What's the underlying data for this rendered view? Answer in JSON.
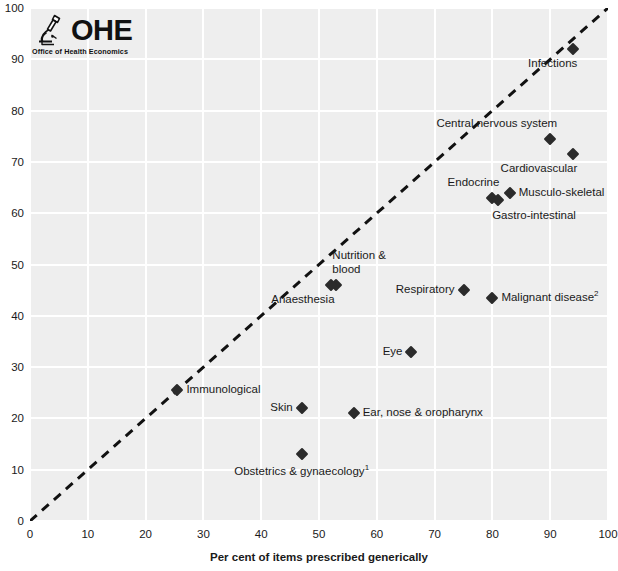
{
  "logo": {
    "wordmark": "OHE",
    "tagline": "Office of Health Economics",
    "icon": "microscope-icon"
  },
  "chart_data": {
    "type": "scatter",
    "title": "",
    "xlabel": "Per cent of items prescribed generically",
    "ylabel": "",
    "xlim": [
      0,
      100
    ],
    "ylim": [
      0,
      100
    ],
    "xticks": [
      0,
      10,
      20,
      30,
      40,
      50,
      60,
      70,
      80,
      90,
      100
    ],
    "yticks": [
      0,
      10,
      20,
      30,
      40,
      50,
      60,
      70,
      80,
      90,
      100
    ],
    "grid": true,
    "legend": "none",
    "reference_line": {
      "name": "parity-line",
      "style": "dashed",
      "from": [
        0,
        0
      ],
      "to": [
        100,
        100
      ]
    },
    "points": [
      {
        "label": "Infections",
        "x": 94,
        "y": 92,
        "label_pos": "below-left"
      },
      {
        "label": "Central nervous system",
        "x": 90,
        "y": 74.5,
        "label_pos": "above-left"
      },
      {
        "label": "Cardiovascular",
        "x": 94,
        "y": 71.5,
        "label_pos": "below-left"
      },
      {
        "label": "Musculo-skeletal",
        "x": 83,
        "y": 64,
        "label_pos": "right"
      },
      {
        "label": "Endocrine",
        "x": 80,
        "y": 63,
        "label_pos": "above-left"
      },
      {
        "label": "Gastro-intestinal",
        "x": 81,
        "y": 62.5,
        "label_pos": "below-right"
      },
      {
        "label": "Nutrition & blood",
        "x": 53,
        "y": 46,
        "label_pos": "above-right"
      },
      {
        "label": "Anaesthesia",
        "x": 52,
        "y": 46,
        "label_pos": "below-left"
      },
      {
        "label": "Respiratory",
        "x": 75,
        "y": 45,
        "label_pos": "left"
      },
      {
        "label": "Malignant disease",
        "x": 80,
        "y": 43.5,
        "label_pos": "right",
        "footnote": "2"
      },
      {
        "label": "Eye",
        "x": 66,
        "y": 33,
        "label_pos": "left"
      },
      {
        "label": "Immunological",
        "x": 25.5,
        "y": 25.5,
        "label_pos": "right"
      },
      {
        "label": "Skin",
        "x": 47,
        "y": 22,
        "label_pos": "left"
      },
      {
        "label": "Ear, nose & oropharynx",
        "x": 56,
        "y": 21,
        "label_pos": "right"
      },
      {
        "label": "Obstetrics & gynaecology",
        "x": 47,
        "y": 13,
        "label_pos": "below-center",
        "footnote": "1"
      }
    ]
  },
  "colors": {
    "plot_background": "#eeeeee",
    "gridline": "#ffffff",
    "marker": "#2b2b2b",
    "reference_line": "#111111",
    "text": "#1a1a1a"
  }
}
